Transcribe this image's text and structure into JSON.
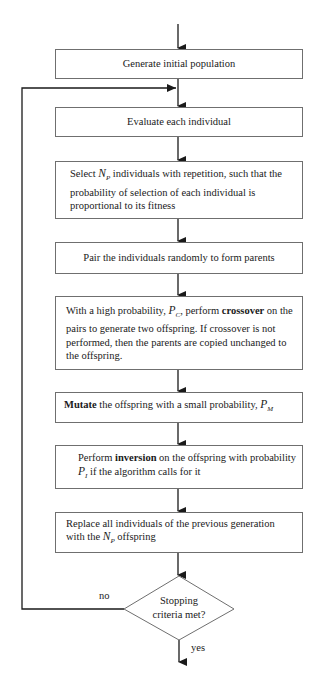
{
  "diagram": {
    "type": "flowchart",
    "steps": [
      {
        "id": "generate",
        "text": "Generate initial population"
      },
      {
        "id": "evaluate",
        "text": "Evaluate each individual"
      },
      {
        "id": "select",
        "pre": "Select ",
        "var": "N",
        "sub": "P",
        "post": " individuals with repetition, such that the probability of selection of each individual is proportional to its fitness"
      },
      {
        "id": "pair",
        "text": "Pair the individuals randomly to form parents"
      },
      {
        "id": "crossover",
        "pre": "With a high probability, ",
        "var": "P",
        "sub": "C",
        "mid": ", perform ",
        "bold": "crossover",
        "post": " on the pairs to generate two offspring.  If crossover is not performed, then the parents are copied unchanged to the offspring."
      },
      {
        "id": "mutate",
        "bold": "Mutate",
        "post": " the offspring with a small probability, ",
        "var": "P",
        "sub": "M"
      },
      {
        "id": "inversion",
        "pre": "Perform ",
        "bold": "inversion",
        "mid": "  on the offspring with probability ",
        "var": "P",
        "sub": "I",
        "post": "  if the algorithm calls for it"
      },
      {
        "id": "replace",
        "pre": "Replace all individuals of the previous generation with the ",
        "var": "N",
        "sub": "P",
        "post": " offspring"
      }
    ],
    "decision": {
      "line1": "Stopping",
      "line2": "criteria met?",
      "no_label": "no",
      "yes_label": "yes"
    },
    "colors": {
      "line": "#1a1a1a",
      "box_border": "#6f6f6f",
      "text": "#1a1a1a",
      "background": "#ffffff"
    }
  }
}
